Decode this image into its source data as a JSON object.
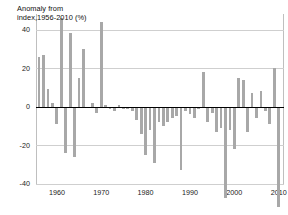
{
  "chart_data": {
    "type": "bar",
    "title": "Anomaly from index,1956-2010 (%)",
    "title_lines": [
      "Anomaly from",
      "index,1956-",
      "2010 (%)"
    ],
    "xlabel": "",
    "ylabel": "Anomaly from index,1956-2010 (%)",
    "ylim": [
      -40,
      48
    ],
    "xlim": [
      1955.3,
      2011.2
    ],
    "grid": true,
    "legend": false,
    "bar_color": "#a8a8a8",
    "zero_line_color": "#000000",
    "gridline_color": "#cfcfcf",
    "background_color": "#ffffff",
    "y_ticks": [
      40,
      20,
      0,
      -20,
      -40
    ],
    "y_tick_labels": [
      "40",
      "20",
      "0",
      "-20",
      "-40"
    ],
    "x_ticks": [
      1960,
      1970,
      1980,
      1990,
      2000,
      2010
    ],
    "x_tick_labels": [
      "1960",
      "1970",
      "1980",
      "1990",
      "2000",
      "2010"
    ],
    "x": [
      1956,
      1957,
      1958,
      1959,
      1960,
      1961,
      1962,
      1963,
      1964,
      1965,
      1966,
      1967,
      1968,
      1969,
      1970,
      1971,
      1972,
      1973,
      1974,
      1975,
      1976,
      1977,
      1978,
      1979,
      1980,
      1981,
      1982,
      1983,
      1984,
      1985,
      1986,
      1987,
      1988,
      1989,
      1990,
      1991,
      1992,
      1993,
      1994,
      1995,
      1996,
      1997,
      1998,
      1999,
      2000,
      2001,
      2002,
      2003,
      2004,
      2005,
      2006,
      2007,
      2008,
      2009,
      2010
    ],
    "values": [
      26,
      27,
      9,
      2,
      -9,
      46,
      -24,
      38,
      -26,
      15,
      30,
      0,
      2,
      -3,
      44,
      1,
      -1,
      -2,
      1,
      -1,
      -1,
      -2,
      -7,
      -14,
      -25,
      -12,
      -29,
      -8,
      -10,
      -8,
      -6,
      -5,
      -33,
      -2,
      -4,
      -6,
      -1,
      18,
      -8,
      -3,
      -13,
      -11,
      -47,
      -12,
      -22,
      15,
      14,
      -13,
      7,
      -6,
      8,
      -2,
      -9,
      20,
      -52
    ],
    "series": [
      {
        "name": "Anomaly",
        "values": [
          26,
          27,
          9,
          2,
          -9,
          46,
          -24,
          38,
          -26,
          15,
          30,
          0,
          2,
          -3,
          44,
          1,
          -1,
          -2,
          1,
          -1,
          -1,
          -2,
          -7,
          -14,
          -25,
          -12,
          -29,
          -8,
          -10,
          -8,
          -6,
          -5,
          -33,
          -2,
          -4,
          -6,
          -1,
          18,
          -8,
          -3,
          -13,
          -11,
          -47,
          -12,
          -22,
          15,
          14,
          -13,
          7,
          -6,
          8,
          -2,
          -9,
          20,
          -52
        ]
      }
    ]
  }
}
